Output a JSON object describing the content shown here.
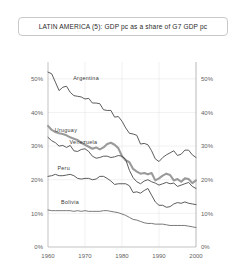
{
  "title": "LATIN AMERICA (5): GDP pc as a share of G7 GDP pc",
  "axes": {
    "y_ticks": [
      "0%",
      "10%",
      "20%",
      "30%",
      "40%",
      "50%"
    ],
    "x_ticks": [
      "1960",
      "1970",
      "1980",
      "1990",
      "2000"
    ],
    "y_axis_right_ticks": [
      "0%",
      "10%",
      "20%",
      "30%",
      "40%",
      "50%"
    ]
  },
  "series_labels": {
    "argentina": "Argentina",
    "uruguay": "Uruguay",
    "venezuela": "Venezuela",
    "peru": "Peru",
    "bolivia": "Bolivia"
  },
  "colors": {
    "argentina": "#4a4a4a",
    "uruguay": "#4a4a4a",
    "venezuela": "#9a9a9a",
    "peru": "#4a4a4a",
    "bolivia": "#6a6a6a",
    "grid": "#e3e3e3",
    "axis": "#9a9a9a",
    "title_border": "#c9c9c9"
  },
  "chart_data": {
    "type": "line",
    "title": "LATIN AMERICA (5): GDP pc as a share of G7 GDP pc",
    "xlabel": "",
    "ylabel": "",
    "xlim": [
      1960,
      2000
    ],
    "ylim": [
      0,
      55
    ],
    "ytick_values": [
      0,
      10,
      20,
      30,
      40,
      50
    ],
    "xtick_values": [
      1960,
      1970,
      1980,
      1990,
      2000
    ],
    "grid": true,
    "legend": "inline-labels",
    "unit": "percent of G7 GDP per capita",
    "x": [
      1960,
      1961,
      1962,
      1963,
      1964,
      1965,
      1966,
      1967,
      1968,
      1969,
      1970,
      1971,
      1972,
      1973,
      1974,
      1975,
      1976,
      1977,
      1978,
      1979,
      1980,
      1981,
      1982,
      1983,
      1984,
      1985,
      1986,
      1987,
      1988,
      1989,
      1990,
      1991,
      1992,
      1993,
      1994,
      1995,
      1996,
      1997,
      1998,
      1999,
      2000
    ],
    "series": [
      {
        "name": "Argentina",
        "color": "#4a4a4a",
        "width": 0.9,
        "values": [
          52.0,
          51.5,
          49.0,
          46.5,
          47.5,
          47.8,
          46.0,
          45.0,
          44.8,
          44.6,
          44.0,
          44.2,
          42.8,
          42.8,
          42.6,
          40.8,
          40.6,
          40.6,
          38.6,
          38.8,
          37.4,
          35.4,
          33.8,
          33.6,
          33.2,
          30.6,
          30.8,
          30.4,
          28.6,
          26.2,
          25.4,
          26.6,
          27.4,
          28.0,
          28.6,
          27.2,
          27.6,
          28.8,
          28.8,
          27.4,
          26.6
        ]
      },
      {
        "name": "Venezuela",
        "color": "#9a9a9a",
        "width": 2.1,
        "values": [
          36.0,
          34.8,
          34.2,
          33.8,
          33.6,
          33.2,
          32.6,
          32.2,
          31.8,
          31.0,
          30.4,
          29.8,
          29.2,
          29.6,
          29.0,
          29.6,
          30.6,
          31.0,
          30.4,
          29.4,
          27.0,
          25.8,
          25.2,
          23.2,
          22.4,
          21.8,
          22.0,
          21.6,
          22.0,
          19.8,
          20.4,
          21.2,
          21.8,
          21.4,
          19.8,
          20.2,
          19.4,
          20.4,
          20.2,
          19.0,
          19.8
        ]
      },
      {
        "name": "Uruguay",
        "color": "#4a4a4a",
        "width": 0.9,
        "values": [
          32.6,
          31.6,
          31.0,
          30.0,
          30.2,
          29.6,
          30.2,
          28.6,
          28.4,
          29.0,
          29.2,
          28.4,
          27.0,
          26.4,
          26.6,
          27.0,
          27.0,
          26.6,
          26.8,
          27.2,
          27.0,
          26.0,
          22.8,
          20.6,
          19.4,
          18.8,
          19.6,
          20.0,
          19.4,
          19.0,
          18.4,
          18.8,
          19.2,
          18.8,
          19.0,
          18.0,
          18.4,
          18.8,
          19.2,
          18.0,
          17.4
        ]
      },
      {
        "name": "Peru",
        "color": "#4a4a4a",
        "width": 0.9,
        "values": [
          21.0,
          21.2,
          21.6,
          21.2,
          21.2,
          21.4,
          21.6,
          21.2,
          20.4,
          20.2,
          20.4,
          20.4,
          20.0,
          20.2,
          21.0,
          21.0,
          20.4,
          19.6,
          18.6,
          18.8,
          18.8,
          18.8,
          18.2,
          16.2,
          16.4,
          16.0,
          16.8,
          17.4,
          15.4,
          13.4,
          12.4,
          12.4,
          11.8,
          12.0,
          12.8,
          13.2,
          13.0,
          13.4,
          13.0,
          12.8,
          12.6
        ]
      },
      {
        "name": "Bolivia",
        "color": "#6a6a6a",
        "width": 0.9,
        "values": [
          11.0,
          10.8,
          10.8,
          10.8,
          10.8,
          10.8,
          10.8,
          10.6,
          10.8,
          10.6,
          10.8,
          10.6,
          10.6,
          10.6,
          10.6,
          10.8,
          10.8,
          10.6,
          10.4,
          10.2,
          9.8,
          9.4,
          8.8,
          8.2,
          8.0,
          7.6,
          7.2,
          7.0,
          7.0,
          6.8,
          6.8,
          6.8,
          6.6,
          6.4,
          6.4,
          6.4,
          6.4,
          6.4,
          6.2,
          6.0,
          5.8
        ]
      }
    ]
  }
}
